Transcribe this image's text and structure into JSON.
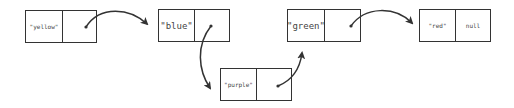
{
  "diagram": {
    "type": "linked-list",
    "nodes": [
      {
        "id": "yellow",
        "value": "\"yellow\"",
        "next": "\"purple\"->blue"
      },
      {
        "id": "blue",
        "value": "\"blue\"",
        "next": ""
      },
      {
        "id": "purple",
        "value": "\"purple\"",
        "next": ""
      },
      {
        "id": "green",
        "value": "\"green\"",
        "next": ""
      },
      {
        "id": "red",
        "value": "\"red\"",
        "next": "null"
      }
    ],
    "edges": [
      {
        "from": "yellow",
        "to": "blue"
      },
      {
        "from": "blue",
        "to": "purple"
      },
      {
        "from": "purple",
        "to": "green"
      },
      {
        "from": "green",
        "to": "red"
      }
    ],
    "colors": {
      "stroke": "#333333",
      "text": "#444444",
      "background": "#ffffff"
    }
  }
}
